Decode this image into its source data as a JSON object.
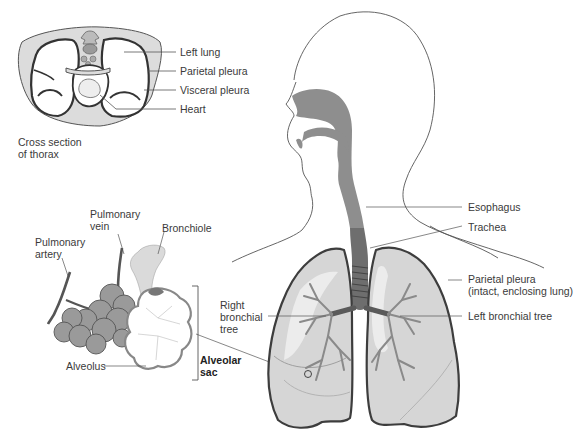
{
  "diagram": {
    "type": "anatomical illustration",
    "panels": [
      {
        "id": "thorax-cross-section",
        "caption_lines": [
          "Cross section",
          "of thorax"
        ]
      },
      {
        "id": "alveoli",
        "caption": ""
      },
      {
        "id": "head-torso-lungs",
        "caption": ""
      }
    ]
  },
  "labels": {
    "left_lung": "Left lung",
    "parietal_pleura": "Parietal pleura",
    "visceral_pleura": "Visceral pleura",
    "heart": "Heart",
    "cross_section_1": "Cross section",
    "cross_section_2": "of thorax",
    "pulmonary_vein_1": "Pulmonary",
    "pulmonary_vein_2": "vein",
    "pulmonary_artery_1": "Pulmonary",
    "pulmonary_artery_2": "artery",
    "bronchiole": "Bronchiole",
    "alveolus": "Alveolus",
    "alveolar_sac_1": "Alveolar",
    "alveolar_sac_2": "sac",
    "right_bronchial_1": "Right",
    "right_bronchial_2": "bronchial",
    "right_bronchial_3": "tree",
    "esophagus": "Esophagus",
    "trachea": "Trachea",
    "parietal_pleura_lung_1": "Parietal pleura",
    "parietal_pleura_lung_2": "(intact, enclosing lung)",
    "left_bronchial_tree": "Left bronchial tree"
  },
  "colors": {
    "background": "#ffffff",
    "outline": "#3d3d3d",
    "lung_fill": "#d6d6d6",
    "airway_fill": "#8e8e8e",
    "bronchi": "#7a7a7a",
    "leader_line": "#555555",
    "thorax_fill": "#dcdcdc"
  }
}
